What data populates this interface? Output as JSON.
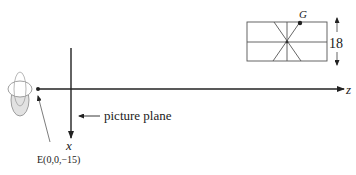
{
  "diagram": {
    "labels": {
      "z_axis": "z",
      "x_axis": "x",
      "picture_plane": "picture plane",
      "eye_point": "E(0,0,−15)",
      "point_g": "G",
      "height_dim": "18"
    },
    "colors": {
      "line": "#222222",
      "object": "#555555",
      "eye_fill": "#dddddd"
    }
  }
}
